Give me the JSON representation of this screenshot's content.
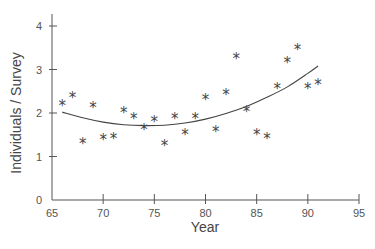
{
  "chart_data": {
    "type": "scatter",
    "title": "",
    "xlabel": "Year",
    "ylabel": "Individuals / Survey",
    "xlim": [
      65,
      95
    ],
    "ylim": [
      0,
      4
    ],
    "x_ticks": [
      65,
      70,
      75,
      80,
      85,
      90,
      95
    ],
    "y_ticks": [
      0,
      1,
      2,
      3,
      4
    ],
    "grid": false,
    "legend": null,
    "marker": "*",
    "series": [
      {
        "name": "Observed",
        "type": "scatter",
        "points": [
          {
            "x": 66,
            "y": 2.2
          },
          {
            "x": 67,
            "y": 2.4
          },
          {
            "x": 68,
            "y": 1.33
          },
          {
            "x": 69,
            "y": 2.15
          },
          {
            "x": 70,
            "y": 1.42
          },
          {
            "x": 71,
            "y": 1.45
          },
          {
            "x": 72,
            "y": 2.05
          },
          {
            "x": 73,
            "y": 1.9
          },
          {
            "x": 74,
            "y": 1.65
          },
          {
            "x": 75,
            "y": 1.85
          },
          {
            "x": 76,
            "y": 1.29
          },
          {
            "x": 77,
            "y": 1.9
          },
          {
            "x": 78,
            "y": 1.53
          },
          {
            "x": 79,
            "y": 1.91
          },
          {
            "x": 80,
            "y": 2.34
          },
          {
            "x": 81,
            "y": 1.62
          },
          {
            "x": 82,
            "y": 2.45
          },
          {
            "x": 83,
            "y": 3.28
          },
          {
            "x": 84,
            "y": 2.08
          },
          {
            "x": 85,
            "y": 1.55
          },
          {
            "x": 86,
            "y": 1.44
          },
          {
            "x": 87,
            "y": 2.59
          },
          {
            "x": 88,
            "y": 3.2
          },
          {
            "x": 89,
            "y": 3.49
          },
          {
            "x": 90,
            "y": 2.6
          },
          {
            "x": 91,
            "y": 2.7
          }
        ]
      },
      {
        "name": "Quadratic fit",
        "type": "line",
        "points": [
          {
            "x": 66,
            "y": 2.02
          },
          {
            "x": 68,
            "y": 1.89
          },
          {
            "x": 70,
            "y": 1.79
          },
          {
            "x": 72,
            "y": 1.73
          },
          {
            "x": 74,
            "y": 1.71
          },
          {
            "x": 76,
            "y": 1.72
          },
          {
            "x": 78,
            "y": 1.77
          },
          {
            "x": 80,
            "y": 1.86
          },
          {
            "x": 82,
            "y": 1.99
          },
          {
            "x": 84,
            "y": 2.15
          },
          {
            "x": 86,
            "y": 2.36
          },
          {
            "x": 88,
            "y": 2.6
          },
          {
            "x": 90,
            "y": 2.91
          },
          {
            "x": 91,
            "y": 3.08
          }
        ]
      }
    ]
  },
  "colors": {
    "axis": "#555555",
    "marker": "#444444",
    "line": "#444444",
    "background": "#ffffff"
  }
}
